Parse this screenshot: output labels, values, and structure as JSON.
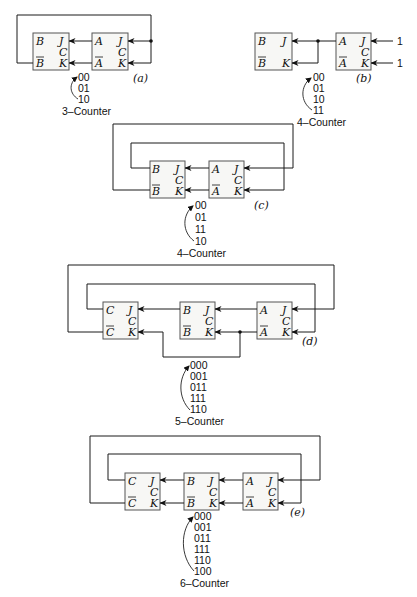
{
  "diagrams": {
    "a": {
      "tag": "(a)",
      "caption": "3–Counter",
      "sequence": [
        "00",
        "01",
        "10"
      ],
      "flipflops": [
        {
          "q": "B",
          "qbar": "B",
          "j": "J",
          "c": "C",
          "k": "K"
        },
        {
          "q": "A",
          "qbar": "A",
          "j": "J",
          "c": "C",
          "k": "K"
        }
      ]
    },
    "b": {
      "tag": "(b)",
      "caption": "4–Counter",
      "sequence": [
        "00",
        "01",
        "10",
        "11"
      ],
      "inputs": [
        "1",
        "1"
      ],
      "flipflops": [
        {
          "q": "B",
          "qbar": "B",
          "j": "J",
          "k": "K"
        },
        {
          "q": "A",
          "qbar": "A",
          "j": "J",
          "c": "C",
          "k": "K"
        }
      ]
    },
    "c": {
      "tag": "(c)",
      "caption": "4–Counter",
      "sequence": [
        "00",
        "01",
        "11",
        "10"
      ],
      "flipflops": [
        {
          "q": "B",
          "qbar": "B",
          "j": "J",
          "c": "C",
          "k": "K"
        },
        {
          "q": "A",
          "qbar": "A",
          "j": "J",
          "c": "C",
          "k": "K"
        }
      ]
    },
    "d": {
      "tag": "(d)",
      "caption": "5–Counter",
      "sequence": [
        "000",
        "001",
        "011",
        "111",
        "110"
      ],
      "flipflops": [
        {
          "q": "C",
          "qbar": "C",
          "j": "J",
          "c": "C",
          "k": "K"
        },
        {
          "q": "B",
          "qbar": "B",
          "j": "J",
          "c": "C",
          "k": "K"
        },
        {
          "q": "A",
          "qbar": "A",
          "j": "J",
          "c": "C",
          "k": "K"
        }
      ]
    },
    "e": {
      "tag": "(e)",
      "caption": "6–Counter",
      "sequence": [
        "000",
        "001",
        "011",
        "111",
        "110",
        "100"
      ],
      "flipflops": [
        {
          "q": "C",
          "qbar": "C",
          "j": "J",
          "c": "C",
          "k": "K"
        },
        {
          "q": "B",
          "qbar": "B",
          "j": "J",
          "c": "C",
          "k": "K"
        },
        {
          "q": "A",
          "qbar": "A",
          "j": "J",
          "c": "C",
          "k": "K"
        }
      ]
    }
  }
}
